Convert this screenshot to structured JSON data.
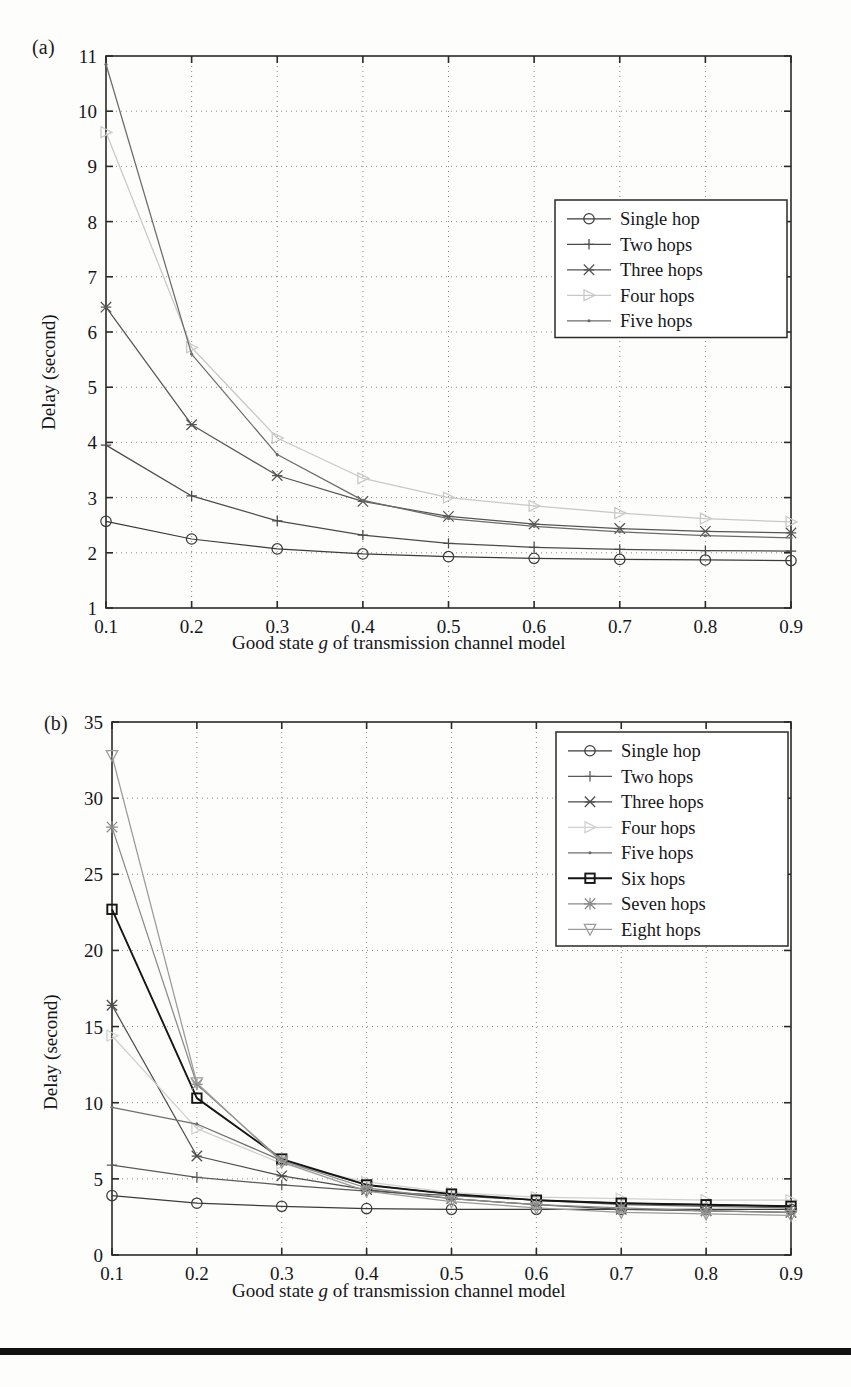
{
  "page": {
    "background": "#fdfdfb",
    "ink": "#16161a",
    "caption_rule_color": "#121212"
  },
  "figure_a": {
    "panel_label": "(a)",
    "xlabel_prefix": "Good state ",
    "xlabel_italic": "g",
    "xlabel_suffix": " of transmission channel model",
    "ylabel": "Delay (second)"
  },
  "figure_b": {
    "panel_label": "(b)",
    "xlabel_prefix": "Good state ",
    "xlabel_italic": "g",
    "xlabel_suffix": " of transmission channel model",
    "ylabel": "Delay (second)"
  },
  "chart_data": [
    {
      "id": "chart-a",
      "type": "line",
      "title": "",
      "panel": "(a)",
      "xlabel": "Good state g of transmission channel model",
      "ylabel": "Delay (second)",
      "x": [
        0.1,
        0.2,
        0.3,
        0.4,
        0.5,
        0.6,
        0.7,
        0.8,
        0.9
      ],
      "xtick_labels": [
        "0.1",
        "0.2",
        "0.3",
        "0.4",
        "0.5",
        "0.6",
        "0.7",
        "0.8",
        "0.9"
      ],
      "ytick_labels": [
        "1",
        "2",
        "3",
        "4",
        "5",
        "6",
        "7",
        "8",
        "9",
        "10",
        "11"
      ],
      "yticks": [
        1,
        2,
        3,
        4,
        5,
        6,
        7,
        8,
        9,
        10,
        11
      ],
      "xlim": [
        0.1,
        0.9
      ],
      "ylim": [
        1,
        11
      ],
      "grid": true,
      "legend_position": "upper-right",
      "series": [
        {
          "name": "Single hop",
          "marker": "circle",
          "color": "#3b3b3b",
          "values": [
            2.57,
            2.25,
            2.07,
            1.98,
            1.93,
            1.9,
            1.88,
            1.87,
            1.86
          ]
        },
        {
          "name": "Two hops",
          "marker": "plus",
          "color": "#4a4a4a",
          "values": [
            3.95,
            3.03,
            2.58,
            2.32,
            2.17,
            2.1,
            2.06,
            2.04,
            2.03
          ]
        },
        {
          "name": "Three hops",
          "marker": "cross-star",
          "color": "#555555",
          "values": [
            6.45,
            4.32,
            3.4,
            2.93,
            2.66,
            2.52,
            2.44,
            2.39,
            2.36
          ]
        },
        {
          "name": "Four hops",
          "marker": "triangle-right",
          "color": "#c8c8c8",
          "values": [
            9.62,
            5.72,
            4.08,
            3.35,
            3.0,
            2.85,
            2.72,
            2.62,
            2.56
          ]
        },
        {
          "name": "Five hops",
          "marker": "dot",
          "color": "#6b6b6b",
          "values": [
            10.85,
            5.6,
            3.78,
            2.95,
            2.62,
            2.48,
            2.38,
            2.31,
            2.27
          ]
        }
      ]
    },
    {
      "id": "chart-b",
      "type": "line",
      "title": "",
      "panel": "(b)",
      "xlabel": "Good state g of transmission channel model",
      "ylabel": "Delay (second)",
      "x": [
        0.1,
        0.2,
        0.3,
        0.4,
        0.5,
        0.6,
        0.7,
        0.8,
        0.9
      ],
      "xtick_labels": [
        "0.1",
        "0.2",
        "0.3",
        "0.4",
        "0.5",
        "0.6",
        "0.7",
        "0.8",
        "0.9"
      ],
      "ytick_labels": [
        "0",
        "5",
        "10",
        "15",
        "20",
        "25",
        "30",
        "35"
      ],
      "yticks": [
        0,
        5,
        10,
        15,
        20,
        25,
        30,
        35
      ],
      "xlim": [
        0.1,
        0.9
      ],
      "ylim": [
        0,
        35
      ],
      "grid": true,
      "legend_position": "upper-right",
      "series": [
        {
          "name": "Single hop",
          "marker": "circle",
          "color": "#3b3b3b",
          "values": [
            3.9,
            3.4,
            3.2,
            3.05,
            3.0,
            3.0,
            3.0,
            3.0,
            3.0
          ]
        },
        {
          "name": "Two hops",
          "marker": "plus",
          "color": "#5a5a5a",
          "values": [
            5.9,
            5.1,
            4.6,
            4.2,
            3.9,
            3.6,
            3.4,
            3.3,
            3.2
          ]
        },
        {
          "name": "Three hops",
          "marker": "cross-star",
          "color": "#4d4d4d",
          "values": [
            16.4,
            6.5,
            5.2,
            4.3,
            3.7,
            3.3,
            3.0,
            2.9,
            2.8
          ]
        },
        {
          "name": "Four hops",
          "marker": "triangle-right",
          "color": "#d0d0d0",
          "values": [
            14.4,
            8.3,
            6.0,
            4.8,
            4.1,
            3.8,
            3.7,
            3.6,
            3.6
          ]
        },
        {
          "name": "Five hops",
          "marker": "dot",
          "color": "#6e6e6e",
          "values": [
            9.7,
            8.6,
            6.2,
            4.6,
            4.0,
            3.6,
            3.3,
            3.2,
            3.1
          ]
        },
        {
          "name": "Six hops",
          "marker": "square",
          "color": "#151515",
          "values": [
            22.7,
            10.3,
            6.3,
            4.6,
            4.0,
            3.6,
            3.4,
            3.3,
            3.2
          ]
        },
        {
          "name": "Seven hops",
          "marker": "asterisk",
          "color": "#8a8a8a",
          "values": [
            28.1,
            11.2,
            6.2,
            4.4,
            3.7,
            3.3,
            3.1,
            2.9,
            2.8
          ]
        },
        {
          "name": "Eight hops",
          "marker": "triangle-down",
          "color": "#9a9a9a",
          "values": [
            32.8,
            11.3,
            6.1,
            4.2,
            3.5,
            3.1,
            2.8,
            2.7,
            2.6
          ]
        }
      ]
    }
  ]
}
